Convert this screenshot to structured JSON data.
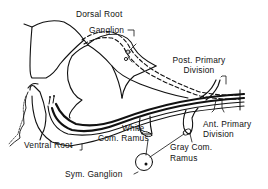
{
  "diagram": {
    "colors": {
      "line": "#111111",
      "background": "#ffffff"
    },
    "labels": {
      "dorsal_root": "Dorsal Root",
      "ganglion": "Ganglion",
      "post_primary_line1": "Post. Primary",
      "post_primary_line2": "Division",
      "ant_primary_line1": "Ant. Primary",
      "ant_primary_line2": "Division",
      "white_line1": "White",
      "white_line2": "Com. Ramus",
      "gray_line1": "Gray Com.",
      "gray_line2": "Ramus",
      "ventral_root": "Ventral Root",
      "sym_ganglion": "Sym. Ganglion"
    },
    "structures": [
      "spinal-cord-gray-matter",
      "dorsal-root",
      "dorsal-root-ganglion",
      "ventral-root",
      "posterior-primary-division",
      "anterior-primary-division",
      "white-communicating-ramus",
      "gray-communicating-ramus",
      "sympathetic-ganglion"
    ]
  }
}
